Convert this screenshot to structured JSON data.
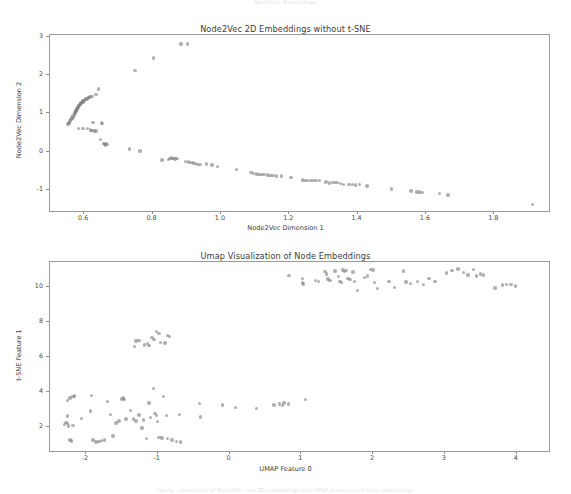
{
  "page": {
    "faint_top_text": "Node2Vec Embeddings",
    "faint_bottom_text": "Figure: comparison of Node2Vec raw 2D embeddings and UMAP projection of node embeddings"
  },
  "chart_data": [
    {
      "type": "scatter",
      "title": "Node2Vec 2D Embeddings without t-SNE",
      "xlabel": "Node2Vec Dimension 1",
      "ylabel": "Node2Vec Dimension 2",
      "xlim": [
        0.5,
        1.96
      ],
      "ylim": [
        -1.55,
        3.05
      ],
      "xticks": [
        0.6,
        0.8,
        1.0,
        1.2,
        1.4,
        1.6,
        1.8
      ],
      "xtick_labels": [
        "0.6",
        "0.8",
        "1.0",
        "1.2",
        "1.4",
        "1.6",
        "1.8"
      ],
      "yticks": [
        -1,
        0,
        1,
        2,
        3
      ],
      "ytick_labels": [
        "-1",
        "0",
        "1",
        "2",
        "3"
      ],
      "grid": false,
      "legend": null,
      "marker_color": "#7f7f7f",
      "marker_opacity": 0.62,
      "points": [
        [
          0.883,
          2.82
        ],
        [
          0.902,
          2.81
        ],
        [
          0.803,
          2.45
        ],
        [
          0.749,
          2.12
        ],
        [
          0.641,
          1.64
        ],
        [
          0.635,
          1.5
        ],
        [
          0.623,
          1.45
        ],
        [
          0.617,
          1.43
        ],
        [
          0.612,
          1.41
        ],
        [
          0.608,
          1.38
        ],
        [
          0.604,
          1.36
        ],
        [
          0.6,
          1.34
        ],
        [
          0.598,
          1.32
        ],
        [
          0.596,
          1.3
        ],
        [
          0.593,
          1.28
        ],
        [
          0.591,
          1.26
        ],
        [
          0.589,
          1.24
        ],
        [
          0.587,
          1.22
        ],
        [
          0.585,
          1.2
        ],
        [
          0.583,
          1.18
        ],
        [
          0.582,
          1.16
        ],
        [
          0.58,
          1.14
        ],
        [
          0.579,
          1.12
        ],
        [
          0.578,
          1.1
        ],
        [
          0.577,
          1.08
        ],
        [
          0.576,
          1.06
        ],
        [
          0.575,
          1.05
        ],
        [
          0.574,
          1.03
        ],
        [
          0.573,
          1.01
        ],
        [
          0.572,
          0.99
        ],
        [
          0.578,
          1.09
        ],
        [
          0.584,
          1.19
        ],
        [
          0.59,
          1.27
        ],
        [
          0.597,
          1.33
        ],
        [
          0.605,
          1.39
        ],
        [
          0.612,
          1.42
        ],
        [
          0.566,
          0.93
        ],
        [
          0.563,
          0.88
        ],
        [
          0.561,
          0.84
        ],
        [
          0.559,
          0.8
        ],
        [
          0.557,
          0.77
        ],
        [
          0.555,
          0.74
        ],
        [
          0.553,
          0.72
        ],
        [
          0.566,
          0.86
        ],
        [
          0.569,
          0.9
        ],
        [
          0.571,
          0.95
        ],
        [
          0.626,
          0.77
        ],
        [
          0.651,
          0.75
        ],
        [
          0.654,
          0.73
        ],
        [
          0.584,
          0.61
        ],
        [
          0.596,
          0.6
        ],
        [
          0.61,
          0.6
        ],
        [
          0.618,
          0.57
        ],
        [
          0.625,
          0.55
        ],
        [
          0.63,
          0.54
        ],
        [
          0.634,
          0.54
        ],
        [
          0.622,
          0.56
        ],
        [
          0.647,
          0.32
        ],
        [
          0.657,
          0.22
        ],
        [
          0.66,
          0.2
        ],
        [
          0.663,
          0.18
        ],
        [
          0.665,
          0.21
        ],
        [
          0.668,
          0.19
        ],
        [
          0.733,
          0.07
        ],
        [
          0.763,
          0.02
        ],
        [
          0.828,
          -0.22
        ],
        [
          0.846,
          -0.21
        ],
        [
          0.85,
          -0.17
        ],
        [
          0.855,
          -0.16
        ],
        [
          0.86,
          -0.18
        ],
        [
          0.866,
          -0.19
        ],
        [
          0.872,
          -0.17
        ],
        [
          0.896,
          -0.25
        ],
        [
          0.905,
          -0.27
        ],
        [
          0.912,
          -0.29
        ],
        [
          0.919,
          -0.3
        ],
        [
          0.926,
          -0.31
        ],
        [
          0.933,
          -0.33
        ],
        [
          0.941,
          -0.33
        ],
        [
          0.958,
          -0.32
        ],
        [
          0.974,
          -0.35
        ],
        [
          0.99,
          -0.38
        ],
        [
          1.046,
          -0.47
        ],
        [
          1.088,
          -0.55
        ],
        [
          1.096,
          -0.57
        ],
        [
          1.104,
          -0.58
        ],
        [
          1.112,
          -0.59
        ],
        [
          1.12,
          -0.6
        ],
        [
          1.128,
          -0.6
        ],
        [
          1.136,
          -0.61
        ],
        [
          1.144,
          -0.62
        ],
        [
          1.152,
          -0.62
        ],
        [
          1.162,
          -0.63
        ],
        [
          1.177,
          -0.63
        ],
        [
          1.205,
          -0.67
        ],
        [
          1.238,
          -0.74
        ],
        [
          1.246,
          -0.75
        ],
        [
          1.254,
          -0.75
        ],
        [
          1.262,
          -0.76
        ],
        [
          1.27,
          -0.76
        ],
        [
          1.278,
          -0.75
        ],
        [
          1.288,
          -0.75
        ],
        [
          1.307,
          -0.79
        ],
        [
          1.318,
          -0.82
        ],
        [
          1.326,
          -0.81
        ],
        [
          1.334,
          -0.8
        ],
        [
          1.342,
          -0.81
        ],
        [
          1.35,
          -0.83
        ],
        [
          1.358,
          -0.85
        ],
        [
          1.375,
          -0.86
        ],
        [
          1.385,
          -0.86
        ],
        [
          1.394,
          -0.87
        ],
        [
          1.405,
          -0.86
        ],
        [
          1.428,
          -0.9
        ],
        [
          1.5,
          -0.97
        ],
        [
          1.556,
          -1.03
        ],
        [
          1.572,
          -1.05
        ],
        [
          1.58,
          -1.05
        ],
        [
          1.588,
          -1.06
        ],
        [
          1.64,
          -1.1
        ],
        [
          1.664,
          -1.13
        ],
        [
          1.912,
          -1.38
        ]
      ]
    },
    {
      "type": "scatter",
      "title": "Umap Visualization of Node Embeddings",
      "xlabel": "UMAP Feature 0",
      "ylabel": "t-SNE Feature 1",
      "xlim": [
        -2.5,
        4.45
      ],
      "ylim": [
        0.6,
        11.4
      ],
      "xticks": [
        -2,
        -1,
        0,
        1,
        2,
        3,
        4
      ],
      "xtick_labels": [
        "-2",
        "-1",
        "0",
        "1",
        "2",
        "3",
        "4"
      ],
      "yticks": [
        2,
        4,
        6,
        8,
        10
      ],
      "ytick_labels": [
        "2",
        "4",
        "6",
        "8",
        "10"
      ],
      "grid": false,
      "legend": null,
      "marker_color": "#7f7f7f",
      "marker_opacity": 0.62,
      "points": [
        [
          0.83,
          10.62
        ],
        [
          1.02,
          10.45
        ],
        [
          1.02,
          10.2
        ],
        [
          1.03,
          10.15
        ],
        [
          1.2,
          10.35
        ],
        [
          1.24,
          10.28
        ],
        [
          1.33,
          10.85
        ],
        [
          1.35,
          10.72
        ],
        [
          1.37,
          10.42
        ],
        [
          1.4,
          10.36
        ],
        [
          1.47,
          10.88
        ],
        [
          1.52,
          10.58
        ],
        [
          1.54,
          10.3
        ],
        [
          1.56,
          10.22
        ],
        [
          1.58,
          10.94
        ],
        [
          1.6,
          10.86
        ],
        [
          1.63,
          10.9
        ],
        [
          1.65,
          10.46
        ],
        [
          1.68,
          10.4
        ],
        [
          1.72,
          10.82
        ],
        [
          1.74,
          10.28
        ],
        [
          1.78,
          9.78
        ],
        [
          1.88,
          10.52
        ],
        [
          1.92,
          10.6
        ],
        [
          1.96,
          10.98
        ],
        [
          2.0,
          10.94
        ],
        [
          2.02,
          10.24
        ],
        [
          2.06,
          9.88
        ],
        [
          2.22,
          10.3
        ],
        [
          2.3,
          9.94
        ],
        [
          2.42,
          10.88
        ],
        [
          2.46,
          10.26
        ],
        [
          2.52,
          10.18
        ],
        [
          2.62,
          10.3
        ],
        [
          2.7,
          10.1
        ],
        [
          2.78,
          10.46
        ],
        [
          2.86,
          10.28
        ],
        [
          3.02,
          10.78
        ],
        [
          3.1,
          10.92
        ],
        [
          3.18,
          11.0
        ],
        [
          3.26,
          10.8
        ],
        [
          3.32,
          10.66
        ],
        [
          3.4,
          10.98
        ],
        [
          3.44,
          10.6
        ],
        [
          3.5,
          10.72
        ],
        [
          3.54,
          10.66
        ],
        [
          3.7,
          9.92
        ],
        [
          3.8,
          10.08
        ],
        [
          3.86,
          10.12
        ],
        [
          3.92,
          10.1
        ],
        [
          3.98,
          10.04
        ],
        [
          -1.32,
          6.58
        ],
        [
          -1.3,
          6.88
        ],
        [
          -1.26,
          6.92
        ],
        [
          -1.18,
          6.66
        ],
        [
          -1.14,
          6.74
        ],
        [
          -1.12,
          6.62
        ],
        [
          -1.08,
          7.1
        ],
        [
          -1.05,
          6.96
        ],
        [
          -1.02,
          7.44
        ],
        [
          -0.98,
          7.3
        ],
        [
          -0.96,
          6.8
        ],
        [
          -0.9,
          6.78
        ],
        [
          -0.86,
          7.2
        ],
        [
          -0.84,
          7.16
        ],
        [
          -2.26,
          3.5
        ],
        [
          -2.22,
          3.62
        ],
        [
          -2.18,
          3.72
        ],
        [
          -2.16,
          3.74
        ],
        [
          -2.26,
          2.6
        ],
        [
          -2.28,
          2.22
        ],
        [
          -2.3,
          2.12
        ],
        [
          -2.26,
          2.18
        ],
        [
          -2.24,
          2.04
        ],
        [
          -2.18,
          2.06
        ],
        [
          -2.22,
          1.22
        ],
        [
          -2.2,
          1.18
        ],
        [
          -2.06,
          2.46
        ],
        [
          -1.94,
          2.88
        ],
        [
          -1.92,
          3.76
        ],
        [
          -1.9,
          1.22
        ],
        [
          -1.86,
          1.12
        ],
        [
          -1.82,
          1.16
        ],
        [
          -1.78,
          1.2
        ],
        [
          -1.74,
          1.22
        ],
        [
          -1.7,
          3.44
        ],
        [
          -1.66,
          2.7
        ],
        [
          -1.62,
          1.46
        ],
        [
          -1.58,
          2.2
        ],
        [
          -1.54,
          2.32
        ],
        [
          -1.5,
          3.58
        ],
        [
          -1.48,
          3.62
        ],
        [
          -1.46,
          3.54
        ],
        [
          -1.44,
          2.42
        ],
        [
          -1.38,
          2.9
        ],
        [
          -1.34,
          2.44
        ],
        [
          -1.3,
          2.32
        ],
        [
          -1.26,
          2.66
        ],
        [
          -1.22,
          1.92
        ],
        [
          -1.2,
          2.38
        ],
        [
          -1.16,
          1.32
        ],
        [
          -1.12,
          3.34
        ],
        [
          -1.1,
          2.52
        ],
        [
          -1.06,
          4.16
        ],
        [
          -1.04,
          2.74
        ],
        [
          -1.02,
          2.62
        ],
        [
          -1.0,
          2.28
        ],
        [
          -0.98,
          1.36
        ],
        [
          -0.94,
          1.34
        ],
        [
          -0.92,
          3.7
        ],
        [
          -0.88,
          2.64
        ],
        [
          -0.86,
          1.3
        ],
        [
          -0.8,
          1.22
        ],
        [
          -0.74,
          1.16
        ],
        [
          -0.68,
          1.12
        ],
        [
          -0.7,
          2.7
        ],
        [
          -0.42,
          3.32
        ],
        [
          -0.4,
          2.54
        ],
        [
          -0.1,
          3.24
        ],
        [
          0.08,
          3.1
        ],
        [
          0.38,
          3.02
        ],
        [
          0.62,
          3.24
        ],
        [
          0.7,
          3.28
        ],
        [
          0.74,
          3.2
        ],
        [
          0.76,
          3.34
        ],
        [
          0.82,
          3.28
        ],
        [
          1.06,
          3.54
        ]
      ]
    }
  ]
}
